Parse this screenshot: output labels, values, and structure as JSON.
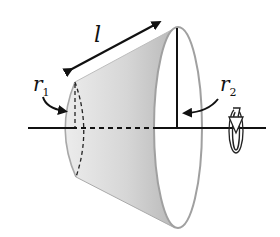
{
  "figure": {
    "labels": {
      "slant_height": "l",
      "small_radius_symbol": "r",
      "small_radius_sub": "1",
      "large_radius_symbol": "r",
      "large_radius_sub": "2"
    },
    "icons": {
      "rotation": "rotation-arrow-icon"
    },
    "colors": {
      "surface_light": "#f2f2f2",
      "surface_dark": "#c4c4c4",
      "outline": "#9a9a9a",
      "lines": "#111111",
      "background": "#ffffff"
    }
  }
}
